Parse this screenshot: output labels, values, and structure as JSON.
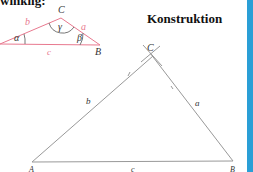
{
  "heading_cut": "winklig:",
  "title": "Konstruktion",
  "sketch": {
    "color": "#e8798f",
    "vertices": {
      "A": "",
      "B": "B",
      "C": "C"
    },
    "sides": {
      "a": "a",
      "b": "b",
      "c": "c"
    },
    "angles": {
      "alpha": "α",
      "beta": "β",
      "gamma": "γ"
    }
  },
  "construction": {
    "color": "#999999",
    "vertices": {
      "A": "A",
      "B": "B",
      "C": "C"
    },
    "sides": {
      "a": "a",
      "b": "b",
      "c": "c"
    }
  },
  "accent": "#2a9fd6"
}
